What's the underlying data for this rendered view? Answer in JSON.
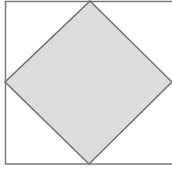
{
  "diagram": {
    "outer_square": {
      "x": 5,
      "y": 1,
      "width": 168,
      "height": 163,
      "stroke": "#7a7a7a",
      "fill": "#ffffff"
    },
    "inner_diamond": {
      "points": [
        [
          90,
          1
        ],
        [
          172,
          82
        ],
        [
          89,
          164
        ],
        [
          5,
          82
        ]
      ],
      "stroke": "#6e6e6e",
      "fill": "#dcdcdc"
    }
  }
}
